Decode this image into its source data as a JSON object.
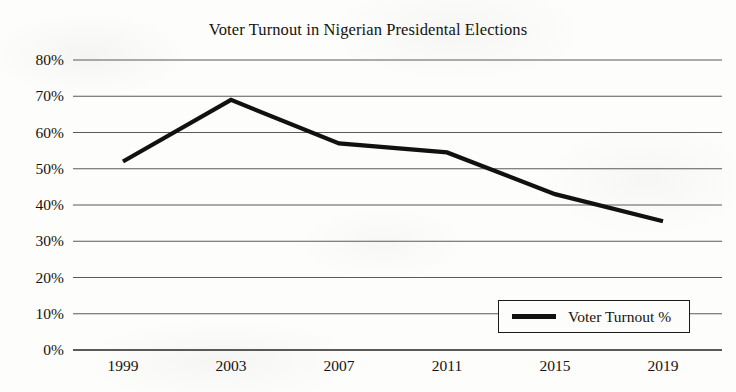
{
  "chart_data": {
    "type": "line",
    "title": "Voter Turnout in Nigerian Presidental Elections",
    "xlabel": "",
    "ylabel": "",
    "categories": [
      "1999",
      "2003",
      "2007",
      "2011",
      "2015",
      "2019"
    ],
    "series": [
      {
        "name": "Voter Turnout %",
        "values": [
          52,
          69,
          57,
          54.5,
          43,
          35.5
        ]
      }
    ],
    "ylim": [
      0,
      80
    ],
    "ytick_values": [
      0,
      10,
      20,
      30,
      40,
      50,
      60,
      70,
      80
    ],
    "ytick_labels": [
      "0%",
      "10%",
      "20%",
      "30%",
      "40%",
      "50%",
      "60%",
      "70%",
      "80%"
    ],
    "grid": true,
    "grid_axis": "y",
    "legend_position": "bottom-right",
    "legend_entries": [
      "Voter Turnout %"
    ],
    "line_color": "#111111",
    "grid_color": "#5a5a5a",
    "background_color": "#fdfdfc"
  },
  "legend": {
    "label": "Voter Turnout %"
  }
}
